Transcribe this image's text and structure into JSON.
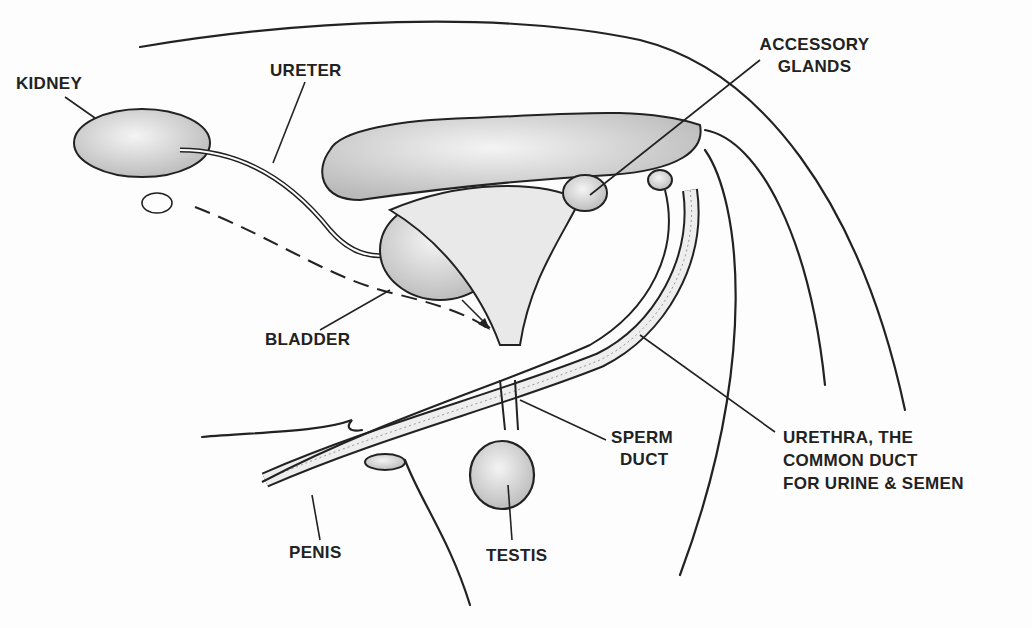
{
  "diagram": {
    "type": "anatomical illustration",
    "colors": {
      "ink": "#222222",
      "shade": "#cfcfcf",
      "background": "#fdfdfd"
    },
    "labels": {
      "kidney": "KIDNEY",
      "ureter": "URETER",
      "accessory_glands_1": "ACCESSORY",
      "accessory_glands_2": "GLANDS",
      "bladder": "BLADDER",
      "sperm_duct_1": "SPERM",
      "sperm_duct_2": "DUCT",
      "urethra_1": "URETHRA, THE",
      "urethra_2": "COMMON DUCT",
      "urethra_3": "FOR URINE & SEMEN",
      "penis": "PENIS",
      "testis": "TESTIS"
    }
  }
}
